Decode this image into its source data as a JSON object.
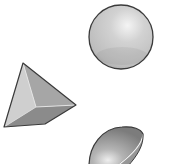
{
  "scene": {
    "description": "Three gray 3D geometric solids on a white background",
    "background_color": "#ffffff",
    "shapes": [
      {
        "id": "sphere",
        "kind": "sphere",
        "fill": "#c9c9c9",
        "highlight": "#f2f2f2",
        "outline": "#3a3a3a"
      },
      {
        "id": "pyramid",
        "kind": "triangular-pyramid",
        "face_light": "#cfcfcf",
        "face_mid": "#a8a8a8",
        "face_dark": "#8a8a8a",
        "outline": "#3a3a3a"
      },
      {
        "id": "hemisphere",
        "kind": "hemisphere",
        "fill": "#9c9c9c",
        "highlight": "#e6e6e6",
        "cut_edge": "#f4f4f4",
        "outline": "#3a3a3a"
      }
    ]
  }
}
